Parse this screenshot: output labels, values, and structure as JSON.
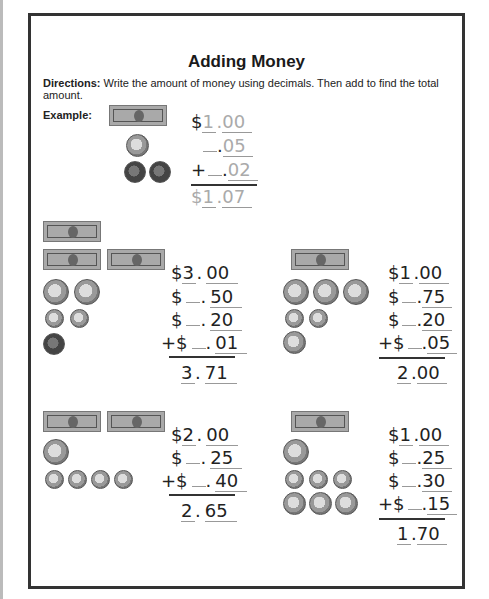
{
  "title": "Adding Money",
  "directions": {
    "label": "Directions:",
    "text": " Write the amount of money using decimals. Then add to find the total amount."
  },
  "example": {
    "label": "Example:",
    "lines": [
      {
        "prefix": "$",
        "dollars": "1",
        "cents": "00"
      },
      {
        "prefix": "",
        "dollars": "",
        "cents": "05"
      },
      {
        "prefix": "+",
        "dollars": "",
        "cents": "02"
      }
    ],
    "total": {
      "prefix": "$",
      "dollars": "1",
      "cents": "07"
    }
  },
  "problems": [
    {
      "lines": [
        {
          "prefix": "$",
          "dollars": "3",
          "cents": "00"
        },
        {
          "prefix": "$",
          "dollars": "",
          "cents": "50"
        },
        {
          "prefix": "$",
          "dollars": "",
          "cents": "20"
        },
        {
          "prefix": "+$",
          "dollars": "",
          "cents": "01"
        }
      ],
      "total": {
        "dollars": "3",
        "cents": "71"
      }
    },
    {
      "lines": [
        {
          "prefix": "$",
          "dollars": "1",
          "cents": "00"
        },
        {
          "prefix": "$",
          "dollars": "",
          "cents": "75"
        },
        {
          "prefix": "$",
          "dollars": "",
          "cents": "20"
        },
        {
          "prefix": "+$",
          "dollars": "",
          "cents": "05"
        }
      ],
      "total": {
        "dollars": "2",
        "cents": "00"
      }
    },
    {
      "lines": [
        {
          "prefix": "$",
          "dollars": "2",
          "cents": "00"
        },
        {
          "prefix": "$",
          "dollars": "",
          "cents": "25"
        },
        {
          "prefix": "+$",
          "dollars": "",
          "cents": "40"
        }
      ],
      "total": {
        "dollars": "2",
        "cents": "65"
      }
    },
    {
      "lines": [
        {
          "prefix": "$",
          "dollars": "1",
          "cents": "00"
        },
        {
          "prefix": "$",
          "dollars": "",
          "cents": "25"
        },
        {
          "prefix": "$",
          "dollars": "",
          "cents": "30"
        },
        {
          "prefix": "+$",
          "dollars": "",
          "cents": "15"
        }
      ],
      "total": {
        "dollars": "1",
        "cents": "70"
      }
    }
  ],
  "icons": {
    "bill": "one-dollar-bill-icon",
    "quarter": "quarter-coin-icon",
    "dime": "dime-coin-icon",
    "nickel": "nickel-coin-icon",
    "penny": "penny-coin-icon"
  }
}
